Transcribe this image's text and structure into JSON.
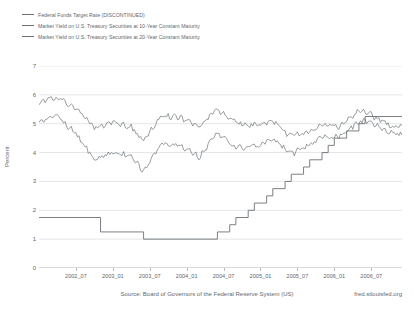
{
  "legend": {
    "items": [
      {
        "label": "Federal Funds Target Rate (DISCONTINUED)",
        "color": "#6d7276"
      },
      {
        "label": "Market Yield on U.S. Treasury Securities at 10-Year Constant Maturity",
        "color": "#6d7276"
      },
      {
        "label": "Market Yield on U.S. Treasury Securities at 20-Year Constant Maturity",
        "color": "#6d7276"
      }
    ]
  },
  "footer": {
    "source": "Source: Board of Governors of the Federal Reserve System (US)",
    "attribution": "fred.stlouisfed.org"
  },
  "chart_data": {
    "type": "line",
    "title": "",
    "xlabel": "",
    "ylabel": "Percent",
    "ylim": [
      0,
      7
    ],
    "yticks": [
      0,
      1,
      2,
      3,
      4,
      5,
      6,
      7
    ],
    "ytick_labels": [
      "0",
      "1",
      "2",
      "3",
      "4",
      "5",
      "6",
      "7"
    ],
    "xlim": [
      "2002_01",
      "2006_12"
    ],
    "xticks": [
      "2002_07",
      "2003_01",
      "2003_07",
      "2004_01",
      "2004_07",
      "2005_01",
      "2005_07",
      "2006_01",
      "2006_07"
    ],
    "grid": true,
    "grid_axis": "y",
    "legend_position": "top-left",
    "line_color": "#6d7276",
    "series": [
      {
        "name": "Federal Funds Target Rate (DISCONTINUED)",
        "style": "step",
        "x": [
          "2002_01",
          "2002_11",
          "2003_06",
          "2004_06",
          "2004_08",
          "2004_09",
          "2004_11",
          "2004_12",
          "2005_02",
          "2005_03",
          "2005_05",
          "2005_06",
          "2005_08",
          "2005_09",
          "2005_11",
          "2005_12",
          "2006_01",
          "2006_03",
          "2006_05",
          "2006_06",
          "2006_12"
        ],
        "values": [
          1.75,
          1.25,
          1.0,
          1.25,
          1.5,
          1.75,
          2.0,
          2.25,
          2.5,
          2.75,
          3.0,
          3.25,
          3.5,
          3.75,
          4.0,
          4.25,
          4.5,
          4.75,
          5.0,
          5.25,
          5.25
        ]
      },
      {
        "name": "Market Yield on U.S. Treasury Securities at 10-Year Constant Maturity",
        "style": "noisy-line",
        "x": [
          "2002_01",
          "2002_04",
          "2002_07",
          "2002_10",
          "2003_01",
          "2003_04",
          "2003_06",
          "2003_09",
          "2003_12",
          "2004_03",
          "2004_06",
          "2004_09",
          "2004_12",
          "2005_03",
          "2005_06",
          "2005_09",
          "2005_11",
          "2006_02",
          "2006_05",
          "2006_07",
          "2006_10",
          "2006_12"
        ],
        "values": [
          5.05,
          5.25,
          4.65,
          3.75,
          4.05,
          3.85,
          3.35,
          4.35,
          4.25,
          3.85,
          4.7,
          4.15,
          4.2,
          4.45,
          3.95,
          4.25,
          4.55,
          4.55,
          5.1,
          5.05,
          4.7,
          4.6
        ]
      },
      {
        "name": "Market Yield on U.S. Treasury Securities at 20-Year Constant Maturity",
        "style": "noisy-line",
        "x": [
          "2002_01",
          "2002_04",
          "2002_07",
          "2002_10",
          "2003_01",
          "2003_04",
          "2003_06",
          "2003_09",
          "2003_12",
          "2004_03",
          "2004_06",
          "2004_09",
          "2004_12",
          "2005_03",
          "2005_06",
          "2005_09",
          "2005_11",
          "2006_02",
          "2006_05",
          "2006_07",
          "2006_10",
          "2006_12"
        ],
        "values": [
          5.75,
          5.9,
          5.55,
          4.85,
          5.05,
          4.9,
          4.4,
          5.3,
          5.2,
          4.9,
          5.5,
          5.05,
          4.95,
          5.05,
          4.55,
          4.75,
          4.95,
          4.9,
          5.45,
          5.3,
          4.95,
          4.9
        ]
      }
    ]
  }
}
